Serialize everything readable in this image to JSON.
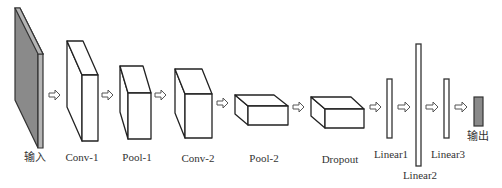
{
  "diagram": {
    "type": "cnn-architecture",
    "layers": [
      {
        "id": "input",
        "label": "输入",
        "shape": "slab",
        "fill": "#8a8a8a"
      },
      {
        "id": "conv1",
        "label": "Conv-1",
        "shape": "box"
      },
      {
        "id": "pool1",
        "label": "Pool-1",
        "shape": "box"
      },
      {
        "id": "conv2",
        "label": "Conv-2",
        "shape": "box"
      },
      {
        "id": "pool2",
        "label": "Pool-2",
        "shape": "box"
      },
      {
        "id": "dropout",
        "label": "Dropout",
        "shape": "box"
      },
      {
        "id": "linear1",
        "label": "Linear1",
        "shape": "bar"
      },
      {
        "id": "linear2",
        "label": "Linear2",
        "shape": "bar"
      },
      {
        "id": "linear3",
        "label": "Linear3",
        "shape": "bar"
      },
      {
        "id": "output",
        "label": "输出",
        "shape": "block",
        "fill": "#8a8a8a"
      }
    ],
    "connections": [
      [
        "input",
        "conv1"
      ],
      [
        "conv1",
        "pool1"
      ],
      [
        "pool1",
        "conv2"
      ],
      [
        "conv2",
        "pool2"
      ],
      [
        "pool2",
        "dropout"
      ],
      [
        "dropout",
        "linear1"
      ],
      [
        "linear1",
        "linear2"
      ],
      [
        "linear2",
        "linear3"
      ],
      [
        "linear3",
        "output"
      ]
    ],
    "colors": {
      "stroke": "#222222",
      "input_fill": "#8a8a8a",
      "output_fill": "#8a8a8a",
      "arrow_stroke": "#555555",
      "background": "#ffffff"
    }
  }
}
